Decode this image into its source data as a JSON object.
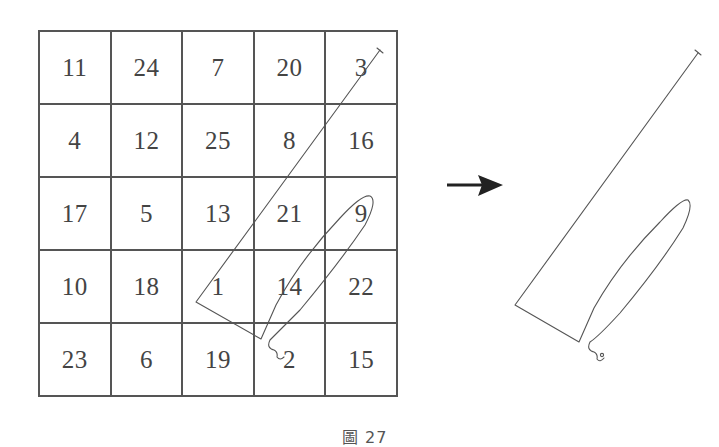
{
  "figure": {
    "caption": "圖 27",
    "grid": {
      "rows": 5,
      "cols": 5,
      "cells": [
        [
          "11",
          "24",
          "7",
          "20",
          "3"
        ],
        [
          "4",
          "12",
          "25",
          "8",
          "16"
        ],
        [
          "17",
          "5",
          "13",
          "21",
          "9"
        ],
        [
          "10",
          "18",
          "1",
          "14",
          "22"
        ],
        [
          "23",
          "6",
          "19",
          "2",
          "15"
        ]
      ]
    },
    "arrow": {
      "direction": "right",
      "color": "#222222"
    },
    "path_shape": {
      "description": "Line traced through cells 3, 8, 13/21, 1, 14, 9, 14, 2 forming a pennant-like shape",
      "stroke_color": "#555555"
    }
  }
}
